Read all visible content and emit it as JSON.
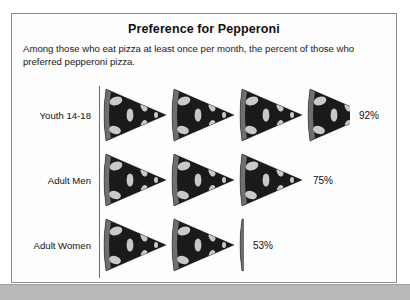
{
  "figure": {
    "title": "Preference for Pepperoni",
    "subtitle": "Among those who eat pizza at least once per month, the percent of those who preferred pepperoni pizza.",
    "icon_name": "pizza-slice-icon",
    "colors": {
      "frame_border": "#8a8a8a",
      "axis": "#6b6b6b",
      "text": "#111111",
      "slice_crust": "#6f6f6f",
      "slice_body": "#1b1b1b",
      "slice_topping": "#d8d8d8",
      "page_band": "#b9b9b9"
    }
  },
  "chart_data": {
    "type": "bar",
    "title": "Preference for Pepperoni",
    "subtitle": "Among those who eat pizza at least once per month, the percent of those who preferred pepperoni pizza.",
    "xlabel": "",
    "ylabel": "",
    "xlim": [
      0,
      100
    ],
    "grid": false,
    "legend": "none",
    "unit": "%",
    "pictogram": {
      "symbol": "pizza slice",
      "symbol_value": 25,
      "symbols_per_row_max": 4
    },
    "categories": [
      "Youth 14-18",
      "Adult Men",
      "Adult Women"
    ],
    "values": [
      92,
      75,
      53
    ],
    "value_labels": [
      "92%",
      "75%",
      "53%"
    ]
  },
  "rows": [
    {
      "label": "Youth 14-18",
      "value": 92,
      "value_label": "92%"
    },
    {
      "label": "Adult Men",
      "value": 75,
      "value_label": "75%"
    },
    {
      "label": "Adult Women",
      "value": 53,
      "value_label": "53%"
    }
  ]
}
